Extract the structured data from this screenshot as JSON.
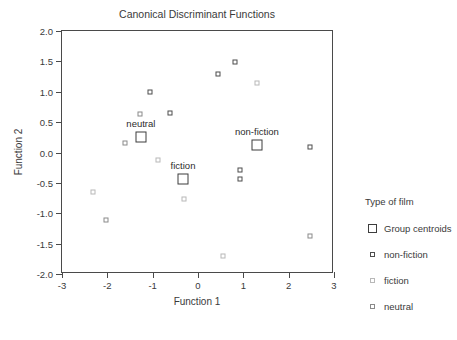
{
  "chart_data": {
    "type": "scatter",
    "title": "Canonical Discriminant Functions",
    "xlabel": "Function 1",
    "ylabel": "Function 2",
    "xlim": [
      -3,
      3
    ],
    "ylim": [
      -2.0,
      2.0
    ],
    "xticks": [
      "-3",
      "-2",
      "-1",
      "0",
      "1",
      "2",
      "3"
    ],
    "xtick_values": [
      -3,
      -2,
      -1,
      0,
      1,
      2,
      3
    ],
    "yticks": [
      "2.0",
      "1.5",
      "1.0",
      "0.5",
      "0.0",
      "-0.5",
      "-1.0",
      "-1.5",
      "-2.0"
    ],
    "ytick_values": [
      2.0,
      1.5,
      1.0,
      0.5,
      0.0,
      -0.5,
      -1.0,
      -1.5,
      -2.0
    ],
    "grid": false,
    "legend_position": "right",
    "series": [
      {
        "name": "non-fiction",
        "marker": "small-square-dark",
        "points": [
          {
            "x": 0.82,
            "y": 1.49
          },
          {
            "x": 0.45,
            "y": 1.3
          },
          {
            "x": -1.05,
            "y": 0.99
          },
          {
            "x": -0.62,
            "y": 0.65
          },
          {
            "x": 0.92,
            "y": -0.28
          },
          {
            "x": 0.92,
            "y": -0.43
          },
          {
            "x": 2.48,
            "y": 0.09
          }
        ]
      },
      {
        "name": "fiction",
        "marker": "small-square-light",
        "points": [
          {
            "x": 1.3,
            "y": 1.15
          },
          {
            "x": -0.88,
            "y": -0.12
          },
          {
            "x": -0.3,
            "y": -0.77
          },
          {
            "x": -2.32,
            "y": -0.65
          },
          {
            "x": 0.55,
            "y": -1.7
          }
        ]
      },
      {
        "name": "neutral",
        "marker": "small-square-medium",
        "points": [
          {
            "x": -1.28,
            "y": 0.63
          },
          {
            "x": -1.62,
            "y": 0.16
          },
          {
            "x": -2.02,
            "y": -1.11
          },
          {
            "x": 2.48,
            "y": -1.37
          }
        ]
      },
      {
        "name": "Group centroids",
        "marker": "large-square",
        "points": [
          {
            "x": -1.26,
            "y": 0.26,
            "label": "neutral"
          },
          {
            "x": -0.33,
            "y": -0.44,
            "label": "fiction"
          },
          {
            "x": 1.3,
            "y": 0.13,
            "label": "non-fiction"
          }
        ]
      }
    ]
  },
  "legend": {
    "title": "Type of film",
    "items": [
      {
        "label": "Group centroids",
        "marker": "centroid"
      },
      {
        "label": "non-fiction",
        "marker": "nonfiction"
      },
      {
        "label": "fiction",
        "marker": "fiction"
      },
      {
        "label": "neutral",
        "marker": "neutral"
      }
    ]
  },
  "colors": {
    "axis": "#4a4a4a",
    "text": "#3a3a3a",
    "nonfiction": "#4d4d4d",
    "fiction": "#b8b8b8",
    "neutral": "#8a8a8a",
    "centroid": "#3d3d3d",
    "background": "#ffffff"
  }
}
